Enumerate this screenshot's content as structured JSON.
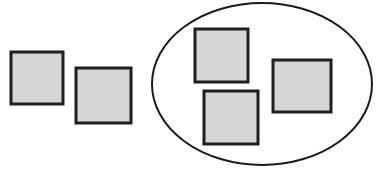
{
  "figure": {
    "title": "",
    "background_color": "#ffffff",
    "width": 384,
    "height": 172
  },
  "style": {
    "square_fill": "#d6d6d6",
    "square_stroke": "#1f1f1f",
    "square_stroke_width": 3,
    "ellipse_fill": "none",
    "ellipse_stroke": "#1a1a1a",
    "ellipse_stroke_width": 2
  },
  "chart_data": {
    "type": "diagram",
    "diagram_kind": "set-membership-venn",
    "title": "",
    "xlabel": "",
    "ylabel": "",
    "groups": [
      {
        "name": "outside-set",
        "label": "",
        "member_count": 2,
        "enclosed": false
      },
      {
        "name": "ellipse-set",
        "label": "",
        "member_count": 3,
        "enclosed": true
      }
    ],
    "containers": [
      {
        "id": "ellipse-container",
        "shape": "ellipse",
        "cx": 262,
        "cy": 84,
        "rx": 110,
        "ry": 81,
        "label": ""
      }
    ],
    "items": [
      {
        "id": "square-1",
        "label": "",
        "group": "outside-set",
        "x": 11,
        "y": 52,
        "w": 52,
        "h": 52
      },
      {
        "id": "square-2",
        "label": "",
        "group": "outside-set",
        "x": 76,
        "y": 68,
        "w": 55,
        "h": 55
      },
      {
        "id": "square-3",
        "label": "",
        "group": "ellipse-set",
        "x": 195,
        "y": 29,
        "w": 53,
        "h": 53
      },
      {
        "id": "square-4",
        "label": "",
        "group": "ellipse-set",
        "x": 273,
        "y": 60,
        "w": 58,
        "h": 52
      },
      {
        "id": "square-5",
        "label": "",
        "group": "ellipse-set",
        "x": 204,
        "y": 91,
        "w": 54,
        "h": 53
      }
    ]
  },
  "annotations": {
    "items": []
  }
}
